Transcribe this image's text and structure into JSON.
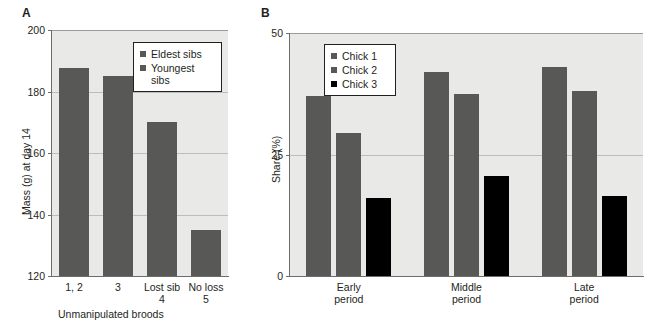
{
  "figure": {
    "panels": [
      {
        "letter": "A",
        "chart_data": {
          "type": "bar",
          "title": "",
          "xlabel": "Unmanipulated broods",
          "ylabel": "Mass (g) at day 14",
          "categories": [
            "1, 2",
            "3",
            "Lost sib\n4",
            "No loss\n5"
          ],
          "values": [
            187.5,
            185,
            170,
            135
          ],
          "ylim": [
            120,
            200
          ],
          "yticks": [
            120,
            140,
            160,
            180,
            200
          ],
          "ytick_labels": [
            "120",
            "140",
            "160",
            "180",
            "200"
          ],
          "grid": true,
          "legend_position": "top-right",
          "series": [
            {
              "name": "Eldest sibs",
              "color": "#585857"
            },
            {
              "name": "Youngest\nsibs",
              "color": "#585857"
            }
          ],
          "bar_color": "#585857"
        }
      },
      {
        "letter": "B",
        "chart_data": {
          "type": "bar",
          "title": "",
          "xlabel": "",
          "ylabel": "Share (%)",
          "categories": [
            "Early\nperiod",
            "Middle\nperiod",
            "Late\nperiod"
          ],
          "ylim": [
            0,
            50
          ],
          "yticks": [
            0,
            25,
            50
          ],
          "ytick_labels": [
            "0",
            "25",
            "50"
          ],
          "grid": true,
          "legend_position": "top-left",
          "series": [
            {
              "name": "Chick 1",
              "color": "#585857",
              "values": [
                37,
                42,
                43
              ]
            },
            {
              "name": "Chick 2",
              "color": "#585857",
              "values": [
                29.5,
                37.5,
                38
              ]
            },
            {
              "name": "Chick 3",
              "color": "#000000",
              "values": [
                16,
                20.5,
                16.5
              ]
            }
          ]
        }
      }
    ]
  }
}
